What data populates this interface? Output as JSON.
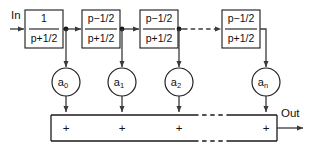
{
  "diagram": {
    "colors": {
      "stroke": "#1a1a1a",
      "wire": "#3a3a3a",
      "background": "#ffffff",
      "text": "#111111"
    },
    "input_label": "In",
    "output_label": "Out",
    "blocks": [
      {
        "numerator": "1",
        "denominator": "p+1/2",
        "x": 25,
        "y": 10,
        "w": 38,
        "h": 38
      },
      {
        "numerator": "p−1/2",
        "denominator": "p+1/2",
        "x": 82,
        "y": 10,
        "w": 38,
        "h": 38
      },
      {
        "numerator": "p−1/2",
        "denominator": "p+1/2",
        "x": 140,
        "y": 10,
        "w": 38,
        "h": 38
      },
      {
        "numerator": "p−1/2",
        "denominator": "p+1/2",
        "x": 222,
        "y": 10,
        "w": 38,
        "h": 38
      }
    ],
    "coefficients": [
      {
        "base": "a",
        "sub": "0",
        "cx": 66,
        "cy": 82,
        "r": 14
      },
      {
        "base": "a",
        "sub": "1",
        "cx": 122,
        "cy": 82,
        "r": 14
      },
      {
        "base": "a",
        "sub": "2",
        "cx": 179,
        "cy": 82,
        "r": 14
      },
      {
        "base": "a",
        "sub": "n",
        "cx": 266,
        "cy": 82,
        "r": 14
      }
    ],
    "adder_bar": {
      "x": 51,
      "y": 115,
      "w": 226,
      "h": 26,
      "symbol": "+",
      "symbol_positions": [
        66,
        122,
        179,
        266
      ],
      "dash_gap_start": 194,
      "dash_gap_end": 227
    },
    "dashed_link": {
      "from_x": 182,
      "to_x": 220,
      "y": 29
    },
    "junction_dots": [
      {
        "x": 66,
        "y": 29
      },
      {
        "x": 122,
        "y": 29
      },
      {
        "x": 179,
        "y": 29
      }
    ]
  }
}
